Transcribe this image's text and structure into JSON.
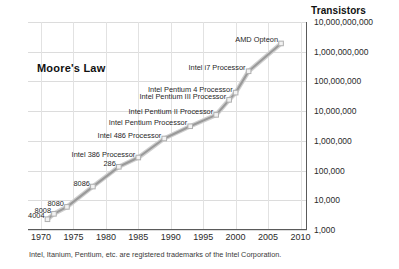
{
  "chart_data": {
    "type": "line",
    "title": "Moore's Law",
    "ylabel": "Transistors",
    "xlabel": "",
    "xlim": [
      1968,
      2011
    ],
    "ylim": [
      1000,
      10000000000
    ],
    "yscale": "log",
    "grid": true,
    "legend": "none",
    "xticks": [
      "1970",
      "1975",
      "1980",
      "1985",
      "1990",
      "1995",
      "2000",
      "2005",
      "2010"
    ],
    "xtick_values": [
      1970,
      1975,
      1980,
      1985,
      1990,
      1995,
      2000,
      2005,
      2010
    ],
    "yticks": [
      "1,000",
      "10,000",
      "100,000",
      "1,000,000",
      "10,000,000",
      "100,000,000",
      "1,000,000,000",
      "10,000,000,000"
    ],
    "ytick_values": [
      1000,
      10000,
      100000,
      1000000,
      10000000,
      100000000,
      1000000000,
      10000000000
    ],
    "series_name": "Transistor count",
    "x": [
      1971,
      1972,
      1974,
      1978,
      1982,
      1985,
      1989,
      1993,
      1997,
      1999,
      2000,
      2002,
      2007
    ],
    "y": [
      2300,
      3500,
      6000,
      29000,
      134000,
      275000,
      1200000,
      3100000,
      7500000,
      24000000,
      42000000,
      220000000,
      1900000000
    ],
    "points": [
      {
        "label": "4004",
        "x": 1971,
        "y": 2300,
        "anchor": "left"
      },
      {
        "label": "8008",
        "x": 1972,
        "y": 3500,
        "anchor": "left"
      },
      {
        "label": "8080",
        "x": 1974,
        "y": 6000,
        "anchor": "left"
      },
      {
        "label": "8086",
        "x": 1978,
        "y": 29000,
        "anchor": "left"
      },
      {
        "label": "286",
        "x": 1982,
        "y": 134000,
        "anchor": "left"
      },
      {
        "label": "Intel 386 Processor",
        "x": 1985,
        "y": 275000,
        "anchor": "left"
      },
      {
        "label": "Intel 486 Processor",
        "x": 1989,
        "y": 1200000,
        "anchor": "left"
      },
      {
        "label": "Intel  Pentium Processor",
        "x": 1993,
        "y": 3100000,
        "anchor": "left"
      },
      {
        "label": "Intel  Pentium II Processor",
        "x": 1997,
        "y": 7500000,
        "anchor": "left"
      },
      {
        "label": "Intel  Pentium III Processor",
        "x": 1999,
        "y": 24000000,
        "anchor": "left"
      },
      {
        "label": "Intel  Pentium 4 Processor",
        "x": 2000,
        "y": 42000000,
        "anchor": "left"
      },
      {
        "label": "Intel  i7 Processor",
        "x": 2002,
        "y": 220000000,
        "anchor": "left"
      },
      {
        "label": "AMD Opteon",
        "x": 2007,
        "y": 1900000000,
        "anchor": "left"
      }
    ],
    "colors": {
      "line": "#9a9a9a",
      "line_highlight": "#cfcfcf",
      "marker": "#b0b0b0",
      "grid": "#dcdcdc",
      "axis": "#5a5a5a",
      "text": "#1f1f1f"
    }
  },
  "footnote": "Intel, Itanium, Pentium, etc. are registered trademarks of the Intel Corporation."
}
